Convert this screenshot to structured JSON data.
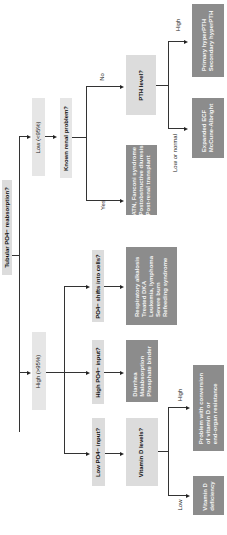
{
  "title": "Tubular PO4− reabsorption?",
  "branches": {
    "low": "Low (<95%)",
    "high": "High (>95%)"
  },
  "nodes": {
    "known_renal": "Known renal problem?",
    "pth_level": "PTH level?",
    "renal_yes_causes": [
      "ATN, Fanconi syndrome",
      "Postobstructive diuresis",
      "Post-renal transplant"
    ],
    "pth_high_causes": [
      "Primary hyperPTH",
      "Secondary hyperPTH"
    ],
    "pth_low_causes": [
      "Expanded ECF",
      "McCune-Albright"
    ],
    "shifts": "PO4− shifts into cells?",
    "shifts_causes": [
      "Respiratory alkalosis",
      "Treated DKA",
      "Leukemia, lymphoma",
      "Severe burn",
      "Refeeding syndrome"
    ],
    "high_input": "High PO4− input?",
    "high_input_causes": [
      "Diarrhea",
      "Malabsorption",
      "Phosphate binder"
    ],
    "low_input": "Low PO4− input?",
    "vitd": "Vitamin D levels?",
    "vitd_high_causes": [
      "Problem with conversion",
      "of vitamin D or",
      "end-organ resistance"
    ],
    "vitd_low_causes": [
      "Vitamin D",
      "deficiency"
    ]
  },
  "edge_labels": {
    "no": "No",
    "yes": "Yes",
    "high": "High",
    "low_or_normal": "Low or normal",
    "vitd_high": "High",
    "vitd_low": "Low"
  }
}
